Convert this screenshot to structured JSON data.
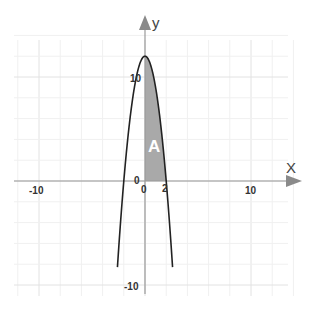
{
  "chart_data": {
    "type": "line",
    "title": "",
    "xlabel": "X",
    "ylabel": "y",
    "xlim": [
      -11.5,
      14
    ],
    "ylim": [
      -11,
      15
    ],
    "grid": true,
    "grid_step": 2,
    "x_ticks": [
      {
        "value": -10,
        "label": "-10"
      },
      {
        "value": 0,
        "label": "0"
      },
      {
        "value": 2,
        "label": "2"
      },
      {
        "value": 10,
        "label": "10"
      }
    ],
    "y_ticks": [
      {
        "value": 10,
        "label": "10"
      },
      {
        "value": 0,
        "label": "0"
      },
      {
        "value": -10,
        "label": "-10"
      }
    ],
    "series": [
      {
        "name": "y = 12 - 3x^2",
        "function": "12 - 3*x*x",
        "domain": [
          -2.6,
          2.6
        ],
        "color": "#222222"
      }
    ],
    "shaded_region": {
      "label": "A",
      "from_x": 0,
      "to_x": 2,
      "under": "y = 12 - 3x^2",
      "color": "#a9a9a9"
    },
    "legend": "none"
  },
  "labels": {
    "x_axis": "X",
    "y_axis": "y",
    "area": "A",
    "origin_y": "0",
    "origin_x": "0",
    "tick_x_neg10": "-10",
    "tick_x_10": "10",
    "tick_x_2": "2",
    "tick_y_10": "10",
    "tick_y_neg10": "-10"
  }
}
